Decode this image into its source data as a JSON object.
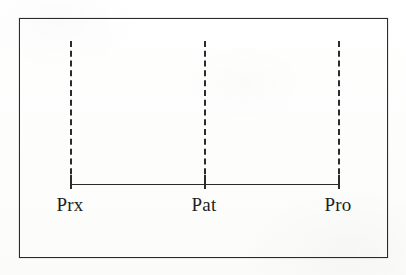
{
  "figure": {
    "kind": "measurement-axis-diagram",
    "background_color": "#fefefe",
    "ink_color": "#2b2b2b",
    "frame": {
      "visible": true,
      "x": 19,
      "y": 18,
      "width": 369,
      "height": 240,
      "border_color": "#2a2a2a",
      "border_width": 1.6
    },
    "axis": {
      "orientation": "horizontal",
      "x_start": 50,
      "x_end": 318,
      "y": 165,
      "line_width": 1.8,
      "color": "#2b2b2b"
    },
    "drop_lines": {
      "style": "dashed",
      "y_top": 22,
      "y_bottom": 165,
      "dash_length": 14,
      "gap_length": 8,
      "line_width": 2,
      "color": "#2b2b2b"
    },
    "ticks": {
      "above_axis": 9,
      "below_axis": 5,
      "line_width": 2,
      "color": "#2b2b2b"
    },
    "labels": {
      "font_size_px": 19,
      "y": 176,
      "color": "#1e1e1e"
    }
  },
  "chart_data": {
    "type": "scatter",
    "title": "",
    "subtitle": "",
    "xlabel": "",
    "ylabel": "",
    "grid": false,
    "legend": null,
    "axis_range_px": [
      50,
      318
    ],
    "categories": [
      "Prx",
      "Pat",
      "Pro"
    ],
    "points": [
      {
        "label": "Prx",
        "x_px": 50,
        "position_fraction": 0.0,
        "tick": true,
        "drop_line": true
      },
      {
        "label": "Pat",
        "x_px": 184,
        "position_fraction": 0.5,
        "tick": true,
        "drop_line": true
      },
      {
        "label": "Pro",
        "x_px": 318,
        "position_fraction": 1.0,
        "tick": true,
        "drop_line": true
      }
    ],
    "values": [
      0.0,
      0.5,
      1.0
    ],
    "annotations": []
  }
}
